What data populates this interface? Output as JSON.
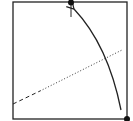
{
  "diagram": {
    "type": "geometric-square-with-arrow",
    "background": "#ffffff",
    "stroke_color": "#222222",
    "square": {
      "x": 13,
      "y": 2,
      "width": 114,
      "height": 117
    },
    "points": [
      {
        "name": "top-point",
        "x": 71,
        "y": 2
      },
      {
        "name": "bottom-right-point",
        "x": 127,
        "y": 119
      }
    ],
    "tick": {
      "x": 71,
      "y1": 5,
      "y2": 17
    },
    "arrow": {
      "from": {
        "x": 121,
        "y": 110
      },
      "to": {
        "x": 74,
        "y": 9
      },
      "style": "curved"
    },
    "line": {
      "dashed": {
        "from": {
          "x": 13,
          "y": 104
        },
        "to": {
          "x": 40,
          "y": 91
        }
      },
      "dotted": {
        "from": {
          "x": 40,
          "y": 91
        },
        "to": {
          "x": 122,
          "y": 50
        }
      }
    }
  }
}
